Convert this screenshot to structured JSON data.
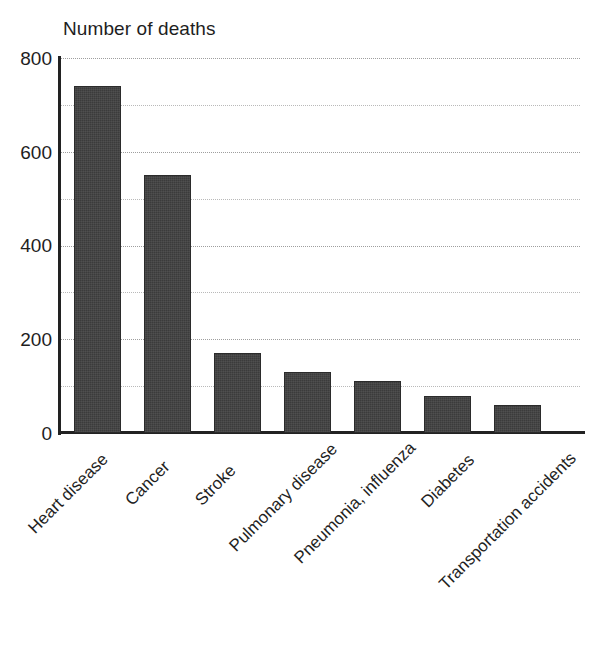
{
  "chart_data": {
    "type": "bar",
    "title": "Number of deaths",
    "xlabel": "",
    "ylabel": "",
    "ylim": [
      0,
      800
    ],
    "grid": true,
    "legend": false,
    "legend_position": "none",
    "y_major_ticks": [
      "0",
      "200",
      "400",
      "600",
      "800"
    ],
    "y_minor_ticks": [
      "100",
      "300",
      "500",
      "700"
    ],
    "categories": [
      "Heart disease",
      "Cancer",
      "Stroke",
      "Pulmonary disease",
      "Pneumonia, influenza",
      "Diabetes",
      "Transportation accidents"
    ],
    "values": [
      740,
      550,
      170,
      130,
      110,
      80,
      60
    ],
    "bar_color": "#3b3b3b",
    "label_rotation_deg": -45
  }
}
